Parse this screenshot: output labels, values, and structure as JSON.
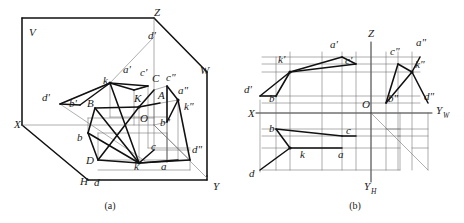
{
  "figure": {
    "captions": [
      {
        "key": "a",
        "text": "(a)",
        "x": 110,
        "y": 209
      },
      {
        "key": "b",
        "text": "(b)",
        "x": 355,
        "y": 209
      }
    ]
  },
  "diagram_a": {
    "name": "pictorial-trihedral-projection",
    "plane_labels": [
      {
        "text": "V",
        "x": 29,
        "y": 36
      },
      {
        "text": "W",
        "x": 200,
        "y": 74
      },
      {
        "text": "H",
        "x": 80,
        "y": 185
      }
    ],
    "axis_labels": [
      {
        "text": "X",
        "x": 14,
        "y": 128
      },
      {
        "text": "Y",
        "x": 213,
        "y": 190
      },
      {
        "text": "Z",
        "x": 154,
        "y": 16
      }
    ],
    "origin_label": {
      "text": "O",
      "x": 140,
      "y": 122
    },
    "point_labels": [
      {
        "text": "d'",
        "x": 148,
        "y": 39
      },
      {
        "text": "a'",
        "x": 123,
        "y": 73
      },
      {
        "text": "c'",
        "x": 140,
        "y": 76
      },
      {
        "text": "k",
        "x": 107,
        "y": 84
      },
      {
        "text": "C",
        "x": 155,
        "y": 82
      },
      {
        "text": "c\"",
        "x": 169,
        "y": 81
      },
      {
        "text": "A",
        "x": 160,
        "y": 98
      },
      {
        "text": "a\"",
        "x": 181,
        "y": 95
      },
      {
        "text": "K",
        "x": 140,
        "y": 102
      },
      {
        "text": "k\"",
        "x": 186,
        "y": 108
      },
      {
        "text": "d'",
        "x": 45,
        "y": 101
      },
      {
        "text": "b'",
        "x": 72,
        "y": 107
      },
      {
        "text": "B",
        "x": 89,
        "y": 106
      },
      {
        "text": "b\"",
        "x": 162,
        "y": 124
      },
      {
        "text": "b",
        "x": 79,
        "y": 140
      },
      {
        "text": "c",
        "x": 153,
        "y": 149
      },
      {
        "text": "d\"",
        "x": 196,
        "y": 152
      },
      {
        "text": "D",
        "x": 88,
        "y": 163
      },
      {
        "text": "k",
        "x": 136,
        "y": 166
      },
      {
        "text": "a",
        "x": 163,
        "y": 167
      },
      {
        "text": "d",
        "x": 96,
        "y": 186
      }
    ]
  },
  "diagram_b": {
    "name": "orthographic-three-view-projection",
    "axis_labels": [
      {
        "text": "Z",
        "x": 371,
        "y": 37
      },
      {
        "text": "X",
        "x": 248,
        "y": 117
      },
      {
        "text": "O",
        "x": 364,
        "y": 107
      }
    ],
    "axis_labels_subscripted": [
      {
        "main": "Y",
        "sub": "W",
        "x": 437,
        "y": 114
      },
      {
        "main": "Y",
        "sub": "H",
        "x": 365,
        "y": 190
      }
    ],
    "point_labels": [
      {
        "text": "a'",
        "x": 331,
        "y": 47
      },
      {
        "text": "c\"",
        "x": 393,
        "y": 54
      },
      {
        "text": "a\"",
        "x": 419,
        "y": 45
      },
      {
        "text": "k'",
        "x": 298,
        "y": 62
      },
      {
        "text": "c'",
        "x": 341,
        "y": 63
      },
      {
        "text": "k\"",
        "x": 412,
        "y": 66
      },
      {
        "text": "d'",
        "x": 246,
        "y": 92
      },
      {
        "text": "b'",
        "x": 272,
        "y": 99
      },
      {
        "text": "b\"",
        "x": 385,
        "y": 100
      },
      {
        "text": "d\"",
        "x": 425,
        "y": 99
      },
      {
        "text": "b",
        "x": 272,
        "y": 131
      },
      {
        "text": "c",
        "x": 348,
        "y": 139
      },
      {
        "text": "k",
        "x": 303,
        "y": 155
      },
      {
        "text": "a",
        "x": 341,
        "y": 155
      },
      {
        "text": "d",
        "x": 251,
        "y": 176
      }
    ]
  }
}
